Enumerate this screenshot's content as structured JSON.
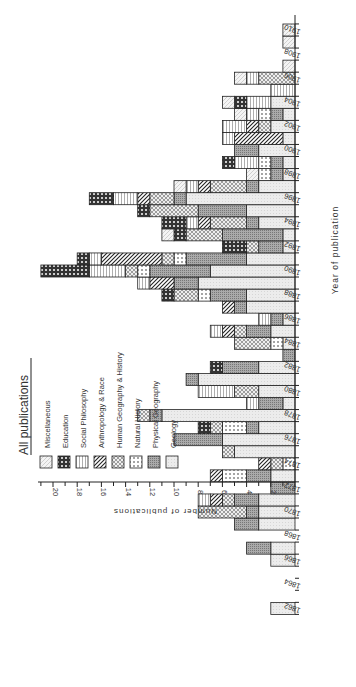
{
  "chart_data": {
    "type": "bar",
    "orientation": "rotated-90-ccw (stacked horizontal bars extending left from baseline)",
    "title": "All publications",
    "xlabel": "Year of publication",
    "ylabel": "Number of publications",
    "ylim": [
      0,
      21
    ],
    "yticks": [
      2,
      4,
      6,
      8,
      10,
      12,
      14,
      16,
      18,
      20
    ],
    "xticks": [
      "1862",
      "1864",
      "1866",
      "1868",
      "1870",
      "1872",
      "1874",
      "1876",
      "1878",
      "1880",
      "1882",
      "1884",
      "1886",
      "1888",
      "1890",
      "1892",
      "1894",
      "1896",
      "1898",
      "1900",
      "1902",
      "1904",
      "1906",
      "1908",
      "1910"
    ],
    "legend_position": "upper-left (rotated)",
    "grid": false,
    "stacked": true,
    "series_order": [
      "Geology",
      "Physical Geography",
      "Natural History",
      "Human Geography & History",
      "Anthropology & Race",
      "Social Philosophy",
      "Education",
      "Miscellaneous"
    ],
    "legend": [
      {
        "name": "Miscellaneous",
        "pattern": "diag-light"
      },
      {
        "name": "Education",
        "pattern": "cross-dark"
      },
      {
        "name": "Social Philosophy",
        "pattern": "vertical-lines"
      },
      {
        "name": "Anthropology & Race",
        "pattern": "diag-heavy"
      },
      {
        "name": "Human Geography & History",
        "pattern": "crosshatch"
      },
      {
        "name": "Natural History",
        "pattern": "dots"
      },
      {
        "name": "Physical Geography",
        "pattern": "dense-grey"
      },
      {
        "name": "Geology",
        "pattern": "light-grey"
      }
    ],
    "years": [
      {
        "year": 1862,
        "values": [
          2,
          0,
          0,
          0,
          0,
          0,
          0,
          0
        ]
      },
      {
        "year": 1866,
        "values": [
          2,
          0,
          0,
          0,
          0,
          0,
          0,
          0
        ]
      },
      {
        "year": 1867,
        "values": [
          2,
          2,
          0,
          0,
          0,
          0,
          0,
          0
        ]
      },
      {
        "year": 1869,
        "values": [
          3,
          2,
          0,
          0,
          0,
          0,
          0,
          0
        ]
      },
      {
        "year": 1870,
        "values": [
          3,
          1,
          0,
          4,
          0,
          0,
          0,
          0
        ]
      },
      {
        "year": 1871,
        "values": [
          3,
          2,
          0,
          1,
          1,
          1,
          0,
          0
        ]
      },
      {
        "year": 1872,
        "values": [
          0,
          2,
          0,
          0,
          0,
          0,
          0,
          0
        ]
      },
      {
        "year": 1873,
        "values": [
          2,
          2,
          2,
          0,
          1,
          0,
          0,
          0
        ]
      },
      {
        "year": 1874,
        "values": [
          0,
          0,
          1,
          1,
          1,
          0,
          0,
          0
        ]
      },
      {
        "year": 1875,
        "values": [
          5,
          0,
          0,
          1,
          0,
          0,
          0,
          0
        ]
      },
      {
        "year": 1876,
        "values": [
          6,
          4,
          0,
          0,
          0,
          0,
          0,
          0
        ]
      },
      {
        "year": 1877,
        "values": [
          3,
          1,
          2,
          1,
          0,
          0,
          1,
          0
        ]
      },
      {
        "year": 1878,
        "values": [
          11,
          1,
          0,
          1,
          0,
          0,
          0,
          0
        ]
      },
      {
        "year": 1879,
        "values": [
          1,
          2,
          0,
          0,
          0,
          1,
          0,
          0
        ]
      },
      {
        "year": 1880,
        "values": [
          3,
          0,
          0,
          2,
          0,
          3,
          0,
          0
        ]
      },
      {
        "year": 1881,
        "values": [
          8,
          1,
          0,
          0,
          0,
          0,
          0,
          0
        ]
      },
      {
        "year": 1882,
        "values": [
          3,
          3,
          0,
          0,
          0,
          0,
          1,
          0
        ]
      },
      {
        "year": 1883,
        "values": [
          0,
          1,
          0,
          0,
          0,
          0,
          0,
          0
        ]
      },
      {
        "year": 1884,
        "values": [
          1,
          0,
          1,
          3,
          0,
          0,
          0,
          0
        ]
      },
      {
        "year": 1885,
        "values": [
          2,
          2,
          0,
          1,
          1,
          1,
          0,
          0
        ]
      },
      {
        "year": 1886,
        "values": [
          1,
          1,
          0,
          0,
          0,
          1,
          0,
          0
        ]
      },
      {
        "year": 1887,
        "values": [
          4,
          1,
          0,
          0,
          1,
          0,
          0,
          0
        ]
      },
      {
        "year": 1888,
        "values": [
          4,
          3,
          1,
          2,
          0,
          0,
          1,
          0
        ]
      },
      {
        "year": 1889,
        "values": [
          8,
          2,
          0,
          0,
          2,
          1,
          0,
          0
        ]
      },
      {
        "year": 1890,
        "values": [
          7,
          5,
          1,
          1,
          0,
          3,
          4,
          0
        ]
      },
      {
        "year": 1891,
        "values": [
          4,
          5,
          1,
          1,
          5,
          1,
          1,
          0
        ]
      },
      {
        "year": 1892,
        "values": [
          1,
          2,
          0,
          1,
          0,
          0,
          2,
          0
        ]
      },
      {
        "year": 1893,
        "values": [
          1,
          5,
          0,
          3,
          0,
          0,
          1,
          1
        ]
      },
      {
        "year": 1894,
        "values": [
          3,
          1,
          0,
          3,
          1,
          1,
          2,
          0
        ]
      },
      {
        "year": 1895,
        "values": [
          4,
          4,
          0,
          4,
          0,
          0,
          1,
          0
        ]
      },
      {
        "year": 1896,
        "values": [
          9,
          1,
          0,
          2,
          1,
          2,
          2,
          0
        ]
      },
      {
        "year": 1897,
        "values": [
          3,
          1,
          0,
          3,
          1,
          1,
          0,
          1
        ]
      },
      {
        "year": 1898,
        "values": [
          1,
          1,
          1,
          0,
          0,
          0,
          0,
          1
        ]
      },
      {
        "year": 1899,
        "values": [
          1,
          1,
          1,
          0,
          0,
          2,
          1,
          0
        ]
      },
      {
        "year": 1900,
        "values": [
          3,
          2,
          0,
          0,
          0,
          0,
          0,
          0
        ]
      },
      {
        "year": 1901,
        "values": [
          1,
          0,
          0,
          0,
          4,
          1,
          0,
          0
        ]
      },
      {
        "year": 1902,
        "values": [
          2,
          0,
          0,
          1,
          1,
          2,
          0,
          0
        ]
      },
      {
        "year": 1903,
        "values": [
          1,
          1,
          1,
          0,
          0,
          1,
          0,
          1
        ]
      },
      {
        "year": 1904,
        "values": [
          2,
          0,
          0,
          0,
          0,
          2,
          1,
          1
        ]
      },
      {
        "year": 1905,
        "values": [
          0,
          0,
          0,
          0,
          0,
          2,
          0,
          0
        ]
      },
      {
        "year": 1906,
        "values": [
          0,
          0,
          0,
          3,
          0,
          1,
          0,
          1
        ]
      },
      {
        "year": 1907,
        "values": [
          0,
          0,
          0,
          0,
          0,
          0,
          0,
          1
        ]
      },
      {
        "year": 1909,
        "values": [
          0,
          0,
          0,
          0,
          0,
          0,
          0,
          1
        ]
      },
      {
        "year": 1910,
        "values": [
          0,
          0,
          0,
          0,
          0,
          0,
          0,
          1
        ]
      }
    ]
  }
}
